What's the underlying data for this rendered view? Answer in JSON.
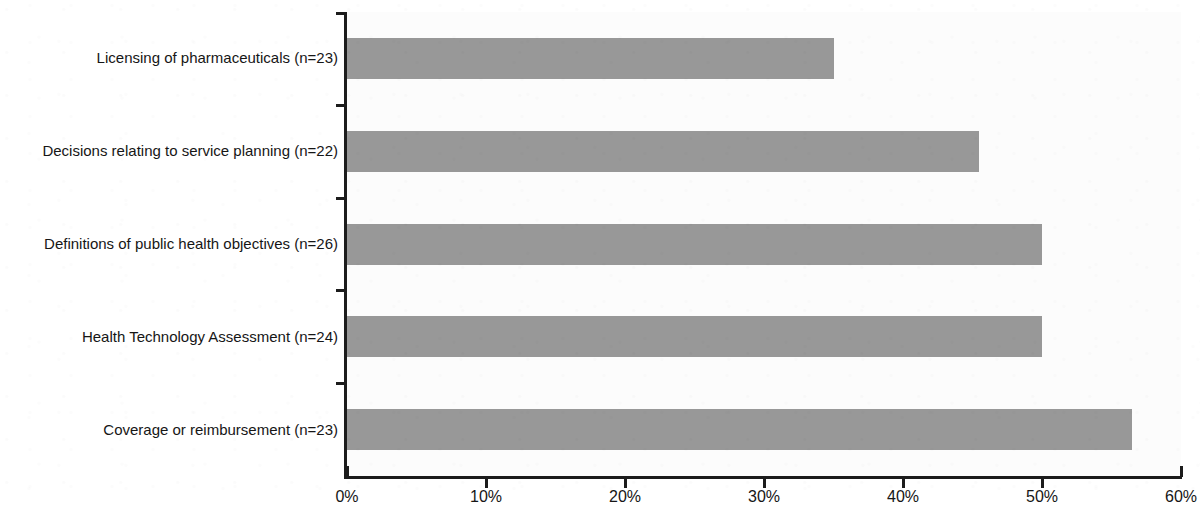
{
  "chart_data": {
    "type": "bar",
    "orientation": "horizontal",
    "title": "",
    "subtitle": "",
    "xlabel": "",
    "ylabel": "",
    "xlim": [
      0,
      60
    ],
    "xunit": "%",
    "grid": false,
    "legend": null,
    "bar_color": "#989898",
    "axis_color": "#1c1c1c",
    "plot_background": "#fcfcfc",
    "xticks": [
      0,
      10,
      20,
      30,
      40,
      50,
      60
    ],
    "xticklabels": [
      "0%",
      "10%",
      "20%",
      "30%",
      "40%",
      "50%",
      "60%"
    ],
    "categories": [
      "Licensing of pharmaceuticals (n=23)",
      "Decisions relating to service planning (n=22)",
      "Definitions of public health objectives (n=26)",
      "Health Technology Assessment (n=24)",
      "Coverage or reimbursement (n=23)"
    ],
    "values": [
      35,
      45.5,
      50,
      50,
      56.5
    ],
    "value_labels": [
      "35%",
      "45.5%",
      "50%",
      "50%",
      "56.5%"
    ],
    "sample_sizes": [
      23,
      22,
      26,
      24,
      23
    ]
  }
}
